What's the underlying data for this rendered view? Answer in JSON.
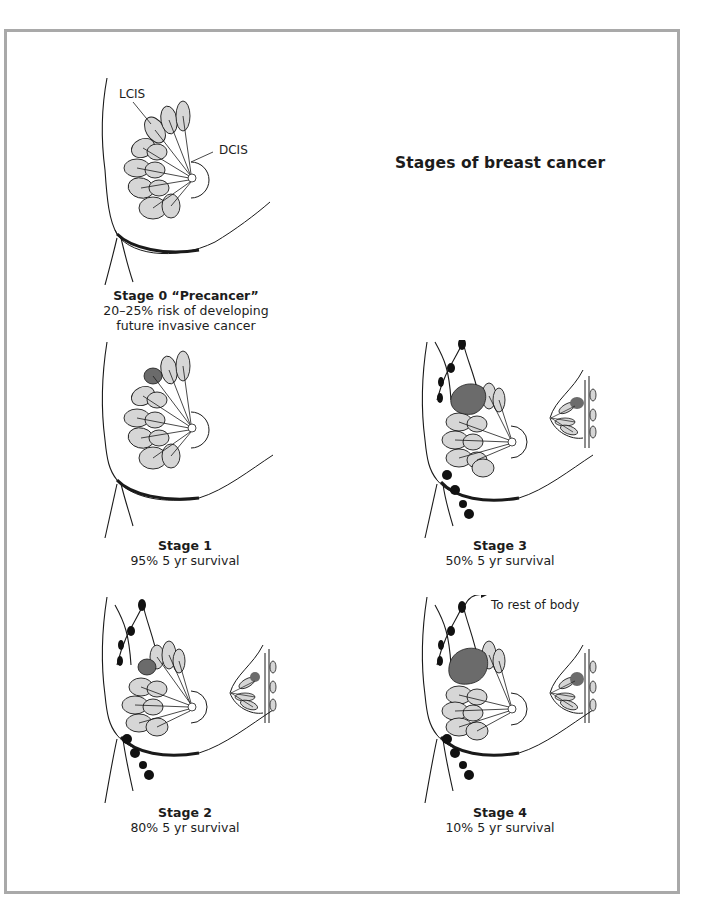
{
  "title": "Stages of breast cancer",
  "colors": {
    "frame_border": "#a9a9a9",
    "tumor": "#6b6b6b",
    "lobule_fill": "#d6d6d6",
    "lymph_node": "#111111",
    "line": "#1a1a1a"
  },
  "figures": [
    {
      "id": "stage-0",
      "annotations": [
        "LCIS",
        "DCIS"
      ],
      "caption_title": "Stage 0 “Precancer”",
      "caption_lines": [
        "20–25% risk of developing",
        "future invasive cancer"
      ],
      "has_tumor": false,
      "has_lymph_nodes": false,
      "has_side_view": false
    },
    {
      "id": "stage-1",
      "caption_title": "Stage 1",
      "caption_lines": [
        "95% 5 yr survival"
      ],
      "has_tumor": true,
      "tumor_size": "small",
      "has_lymph_nodes": false,
      "has_side_view": false
    },
    {
      "id": "stage-2",
      "caption_title": "Stage 2",
      "caption_lines": [
        "80% 5 yr survival"
      ],
      "has_tumor": true,
      "tumor_size": "small",
      "has_lymph_nodes": true,
      "has_side_view": true
    },
    {
      "id": "stage-3",
      "caption_title": "Stage 3",
      "caption_lines": [
        "50% 5 yr survival"
      ],
      "has_tumor": true,
      "tumor_size": "large",
      "has_lymph_nodes": true,
      "has_side_view": true
    },
    {
      "id": "stage-4",
      "annotations": [
        "To rest of body"
      ],
      "caption_title": "Stage 4",
      "caption_lines": [
        "10% 5 yr survival"
      ],
      "has_tumor": true,
      "tumor_size": "large",
      "has_lymph_nodes": true,
      "has_side_view": true
    }
  ]
}
